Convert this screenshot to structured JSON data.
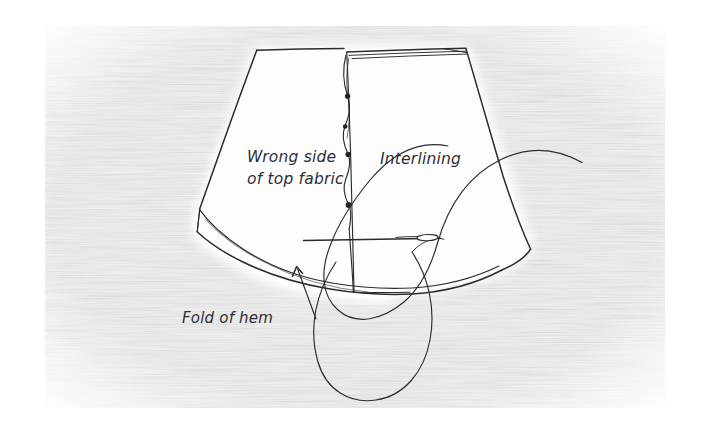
{
  "illustration": {
    "title": "Hand-sewn hem with interlining",
    "medium": "pencil sketch on textured watercolour paper",
    "canvas": {
      "width": 704,
      "height": 435,
      "background_color": "#ffffff"
    },
    "paper": {
      "texture": "horizontal laid watercolour paper grain",
      "tone_color": "#ececec",
      "bounds": {
        "x": 45,
        "y": 26,
        "width": 620,
        "height": 382
      }
    },
    "ink_color": "#2b2b2f",
    "cloth_color": "#fdfdfd"
  },
  "labels": [
    {
      "name": "wrong-side-label",
      "lines": [
        "Wrong side",
        "of top fabric"
      ],
      "line1": "Wrong side",
      "line2": "of top fabric",
      "x": 247,
      "y": 162,
      "style": "italic"
    },
    {
      "name": "interlining-label",
      "lines": [
        "Interlining"
      ],
      "line1": "Interlining",
      "x": 380,
      "y": 164,
      "style": "italic"
    },
    {
      "name": "fold-of-hem-label",
      "lines": [
        "Fold of hem"
      ],
      "line1": "Fold of hem",
      "x": 182,
      "y": 323,
      "style": "italic",
      "has_leader_arrow": true,
      "arrow_points_to": {
        "x": 296,
        "y": 267
      }
    }
  ],
  "elements": [
    {
      "name": "top-fabric-panel",
      "description": "trapezoidal panel, wrong side up, left of centre seam"
    },
    {
      "name": "interlining-panel",
      "description": "trapezoidal panel right of centre seam"
    },
    {
      "name": "centre-seam-stitch-line",
      "description": "wavy vertical basting line with four knots"
    },
    {
      "name": "hem-fold-edge",
      "description": "double curved line along lower left edge"
    },
    {
      "name": "sewing-needle",
      "description": "straight needle with oval eye lying horizontally"
    },
    {
      "name": "thread",
      "description": "long thread arcing up right and looping below the cloth"
    }
  ]
}
